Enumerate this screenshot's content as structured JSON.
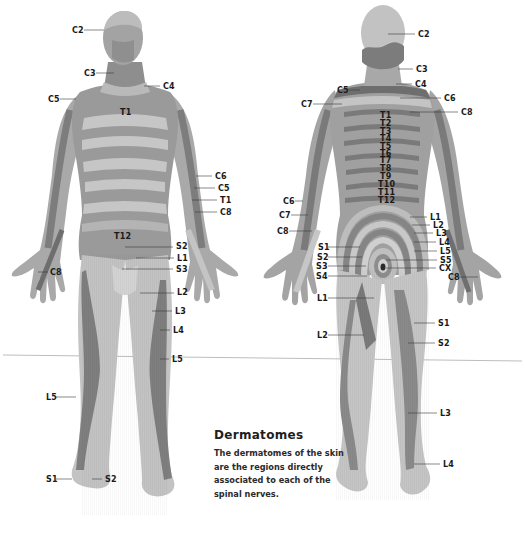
{
  "title": "Dermatomes",
  "description": "The dermatomes of the skin are the regions directly associated to each of the spinal nerves.",
  "colors": {
    "background": "#ffffff",
    "skin_light": "#c9c9c9",
    "skin_mid": "#a6a6a6",
    "skin_dark": "#7e7e7e",
    "band_dark": "#6f6f6f",
    "label_text": "#1a1a1a",
    "divider_line": "#bdbdbd"
  },
  "front_view": {
    "labels": [
      {
        "text": "C2",
        "x": 72,
        "y": 26
      },
      {
        "text": "C3",
        "x": 84,
        "y": 69
      },
      {
        "text": "C4",
        "x": 163,
        "y": 83
      },
      {
        "text": "C5",
        "x": 48,
        "y": 95
      },
      {
        "text": "T1",
        "x": 120,
        "y": 108
      },
      {
        "text": "C6",
        "x": 215,
        "y": 172
      },
      {
        "text": "C5",
        "x": 218,
        "y": 184
      },
      {
        "text": "T1",
        "x": 220,
        "y": 196
      },
      {
        "text": "C8",
        "x": 220,
        "y": 208
      },
      {
        "text": "T12",
        "x": 114,
        "y": 232
      },
      {
        "text": "S2",
        "x": 176,
        "y": 242
      },
      {
        "text": "L1",
        "x": 177,
        "y": 254
      },
      {
        "text": "C8",
        "x": 50,
        "y": 268
      },
      {
        "text": "S3",
        "x": 176,
        "y": 265
      },
      {
        "text": "L2",
        "x": 177,
        "y": 288
      },
      {
        "text": "L3",
        "x": 175,
        "y": 307
      },
      {
        "text": "L4",
        "x": 173,
        "y": 326
      },
      {
        "text": "L5",
        "x": 172,
        "y": 355
      },
      {
        "text": "L5",
        "x": 46,
        "y": 393
      },
      {
        "text": "S1",
        "x": 46,
        "y": 475
      },
      {
        "text": "S2",
        "x": 105,
        "y": 475
      }
    ]
  },
  "back_view": {
    "labels": [
      {
        "text": "C2",
        "x": 418,
        "y": 31
      },
      {
        "text": "C3",
        "x": 416,
        "y": 65
      },
      {
        "text": "C4",
        "x": 415,
        "y": 80
      },
      {
        "text": "C5",
        "x": 337,
        "y": 86
      },
      {
        "text": "C6",
        "x": 444,
        "y": 94
      },
      {
        "text": "C7",
        "x": 301,
        "y": 100
      },
      {
        "text": "C8",
        "x": 461,
        "y": 108
      },
      {
        "text": "T1",
        "x": 380,
        "y": 111
      },
      {
        "text": "T2",
        "x": 380,
        "y": 119
      },
      {
        "text": "T3",
        "x": 380,
        "y": 127
      },
      {
        "text": "T4",
        "x": 380,
        "y": 134
      },
      {
        "text": "T5",
        "x": 380,
        "y": 142
      },
      {
        "text": "T6",
        "x": 380,
        "y": 149
      },
      {
        "text": "T7",
        "x": 380,
        "y": 156
      },
      {
        "text": "T8",
        "x": 380,
        "y": 164
      },
      {
        "text": "T9",
        "x": 380,
        "y": 172
      },
      {
        "text": "T10",
        "x": 378,
        "y": 180
      },
      {
        "text": "T11",
        "x": 378,
        "y": 188
      },
      {
        "text": "T12",
        "x": 378,
        "y": 196
      },
      {
        "text": "C6",
        "x": 283,
        "y": 197
      },
      {
        "text": "C7",
        "x": 279,
        "y": 211
      },
      {
        "text": "L1",
        "x": 430,
        "y": 213
      },
      {
        "text": "L2",
        "x": 433,
        "y": 221
      },
      {
        "text": "C8",
        "x": 277,
        "y": 227
      },
      {
        "text": "L3",
        "x": 436,
        "y": 229
      },
      {
        "text": "L4",
        "x": 439,
        "y": 238
      },
      {
        "text": "S1",
        "x": 318,
        "y": 243
      },
      {
        "text": "L5",
        "x": 440,
        "y": 247
      },
      {
        "text": "S2",
        "x": 317,
        "y": 253
      },
      {
        "text": "S5",
        "x": 440,
        "y": 256
      },
      {
        "text": "S3",
        "x": 316,
        "y": 262
      },
      {
        "text": "CX",
        "x": 439,
        "y": 264
      },
      {
        "text": "S4",
        "x": 316,
        "y": 272
      },
      {
        "text": "C8",
        "x": 448,
        "y": 273
      },
      {
        "text": "L1",
        "x": 317,
        "y": 294
      },
      {
        "text": "S1",
        "x": 438,
        "y": 319
      },
      {
        "text": "L2",
        "x": 317,
        "y": 331
      },
      {
        "text": "S2",
        "x": 438,
        "y": 339
      },
      {
        "text": "L3",
        "x": 440,
        "y": 409
      },
      {
        "text": "L4",
        "x": 443,
        "y": 460
      }
    ]
  }
}
